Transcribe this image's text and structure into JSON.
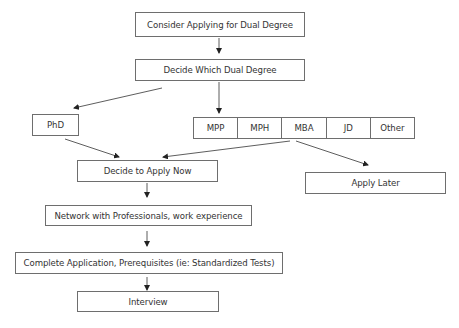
{
  "diagram": {
    "nodes": {
      "consider": "Consider Applying for Dual Degree",
      "decide_which": "Decide Which Dual Degree",
      "phd": "PhD",
      "degrees": [
        "MPP",
        "MPH",
        "MBA",
        "JD",
        "Other"
      ],
      "apply_now": "Decide to Apply Now",
      "apply_later": "Apply Later",
      "network": "Network with Professionals, work experience",
      "complete": "Complete Application,  Prerequisites (ie: Standardized Tests)",
      "interview": "Interview"
    },
    "edges": [
      {
        "from": "consider",
        "to": "decide_which"
      },
      {
        "from": "decide_which",
        "to": "phd"
      },
      {
        "from": "decide_which",
        "to": "degrees"
      },
      {
        "from": "phd",
        "to": "apply_now"
      },
      {
        "from": "degrees",
        "to": "apply_now"
      },
      {
        "from": "degrees",
        "to": "apply_later"
      },
      {
        "from": "apply_now",
        "to": "network"
      },
      {
        "from": "network",
        "to": "complete"
      },
      {
        "from": "complete",
        "to": "interview"
      }
    ],
    "colors": {
      "line": "#333333",
      "border": "#6e6e6e",
      "text": "#333333"
    }
  }
}
